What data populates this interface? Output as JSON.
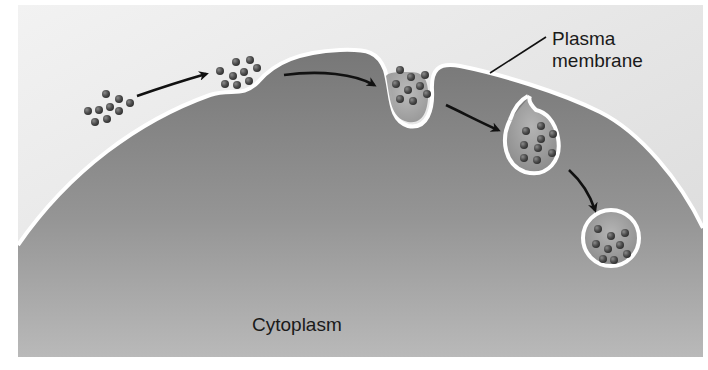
{
  "figure": {
    "labels": {
      "plasma_membrane_line1": "Plasma",
      "plasma_membrane_line2": "membrane",
      "cytoplasm": "Cytoplasm"
    },
    "stages": [
      {
        "name": "extracellular particles",
        "particles": 9
      },
      {
        "name": "particles binding at shallow pit",
        "particles": 9
      },
      {
        "name": "deep invagination",
        "particles": 9
      },
      {
        "name": "pinching vesicle",
        "particles": 8
      },
      {
        "name": "free vesicle in cytoplasm",
        "particles": 9
      }
    ],
    "arrows": 4,
    "colors": {
      "background_top": "#ececec",
      "background_bottom": "#d8d8d8",
      "cytoplasm_top": "#7e7e7e",
      "cytoplasm_bottom": "#b8b8b8",
      "membrane": "#ffffff",
      "particle": "#4a4a4a",
      "arrow": "#111111",
      "text": "#1a1a1a"
    }
  }
}
